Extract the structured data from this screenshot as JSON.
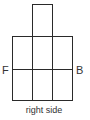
{
  "diagram": {
    "type": "net-view",
    "labels": {
      "left": "F",
      "right": "B",
      "caption": "right side"
    },
    "stroke_color": "#2a2a2a",
    "grid": {
      "top_cell": {
        "x": 32,
        "y": 4,
        "w": 20,
        "h": 32
      },
      "main": {
        "x": 12,
        "y": 36,
        "w": 60,
        "h": 64
      },
      "columns": 3,
      "rows": 2
    }
  }
}
